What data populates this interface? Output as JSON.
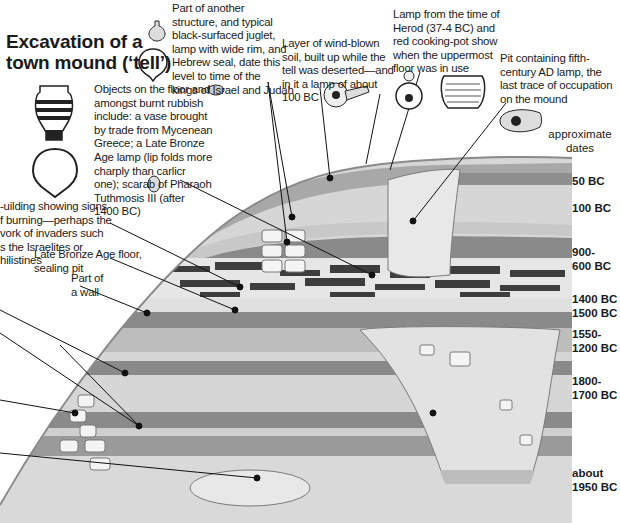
{
  "title": {
    "line1": "Excavation of a",
    "line2": "town mound (‘tell’)"
  },
  "captions": {
    "kings_level": [
      "Part of another",
      "structure, and typical",
      "black-surfaced juglet,",
      "lamp with wide rim, and",
      "Hebrew seal, date this",
      "level to time of the",
      "kings of Israel and Judah"
    ],
    "wind_blown": [
      "Layer of wind-blown",
      "soil, built up while the",
      "tell was deserted—and",
      "in it a lamp of about",
      "100 BC"
    ],
    "herod": [
      "Lamp from the time of",
      "Herod (37-4 BC) and",
      "red cooking-pot show",
      "when the uppermost",
      "floor was in use"
    ],
    "fifth_century": [
      "Pit containing fifth-",
      "century AD lamp, the",
      "last trace of occupation",
      "on the mound"
    ],
    "burnt_rubbish": [
      "Objects on the floor and",
      "amongst burnt rubbish",
      "include: a vase brought",
      "by trade from Mycenean",
      "Greece; a Late Bronze",
      "Age lamp (lip folds more",
      "charply than carlicr",
      "one); scarab of Pharaoh",
      "Tuthmosis III (after",
      "1400 BC)"
    ],
    "burning_building": [
      "-uilding showing signs",
      "f burning—perhaps the",
      "vork of invaders such",
      "s the Israelites or",
      "hilistines"
    ],
    "lb_floor": [
      "Late Bronze Age floor,",
      "sealing pit"
    ],
    "wall": [
      "Part of",
      "a wall"
    ]
  },
  "dates": {
    "header": [
      "approximate",
      "dates"
    ],
    "labels": [
      {
        "text": [
          "50 BC"
        ],
        "top": 175
      },
      {
        "text": [
          "100 BC"
        ],
        "top": 202
      },
      {
        "text": [
          "900-",
          "600 BC"
        ],
        "top": 246
      },
      {
        "text": [
          "1400 BC"
        ],
        "top": 293
      },
      {
        "text": [
          "1500 BC"
        ],
        "top": 307
      },
      {
        "text": [
          "1550-",
          "1200 BC"
        ],
        "top": 328
      },
      {
        "text": [
          "1800-",
          "1700 BC"
        ],
        "top": 375
      },
      {
        "text": [
          "about",
          "1950 BC"
        ],
        "top": 467
      }
    ]
  },
  "icons": [
    "juglet-icon",
    "wide-rim-lamp-icon",
    "hebrew-seal-icon",
    "roman-lamp-icon",
    "herodian-lamp-icon",
    "cooking-pot-icon",
    "fifth-century-lamp-icon",
    "mycenean-vase-icon",
    "late-bronze-lamp-icon",
    "scarab-icon"
  ],
  "colors": {
    "light_layer": "#d9d9d9",
    "mid_layer": "#b3b3b3",
    "dark_layer": "#8a8a8a",
    "rubble": "#3d3d3d",
    "stone": "#f4f4f4",
    "outline": "#7a7a7a"
  }
}
